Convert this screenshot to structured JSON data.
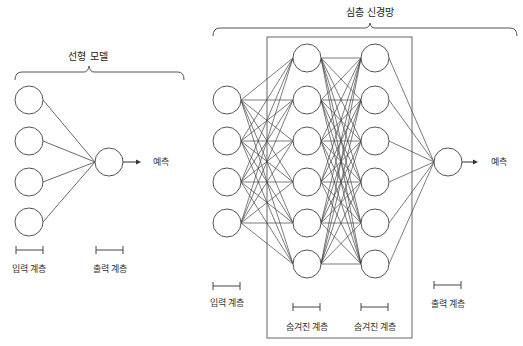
{
  "linear_model": {
    "title": "선형 모델",
    "prediction_label": "예측",
    "input_layer_label": "입력 계층",
    "output_layer_label": "출력 계층",
    "input_nodes": [
      {
        "x": 29,
        "y": 100
      },
      {
        "x": 29,
        "y": 141
      },
      {
        "x": 29,
        "y": 182
      },
      {
        "x": 29,
        "y": 222
      }
    ],
    "output_node": {
      "x": 109,
      "y": 162
    },
    "node_radius": 14
  },
  "deep_network": {
    "title": "심층 신경망",
    "prediction_label": "예측",
    "input_layer_label": "입력 계층",
    "hidden_layer_1_label": "숨겨진 계층",
    "hidden_layer_2_label": "숨겨진 계층",
    "output_layer_label": "출력 계층",
    "input_nodes_y": [
      100,
      141,
      182,
      223
    ],
    "input_x": 227,
    "hidden1_x": 307,
    "hidden2_x": 375,
    "hidden_nodes_y": [
      58,
      100,
      141,
      182,
      223,
      264
    ],
    "output_node": {
      "x": 448,
      "y": 162
    },
    "node_radius": 14
  },
  "colors": {
    "stroke": "#444444",
    "box": "#666666",
    "text": "#333333"
  }
}
